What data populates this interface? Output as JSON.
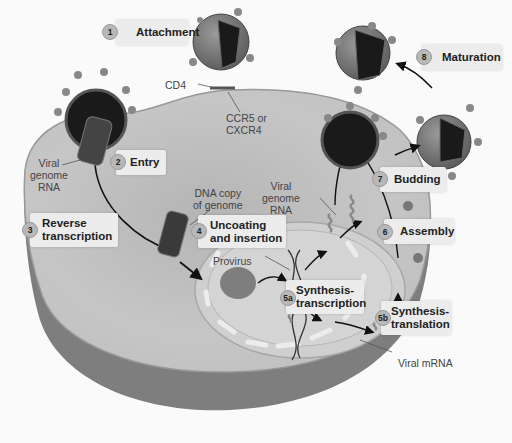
{
  "diagram": {
    "colors": {
      "background": "#fafafa",
      "cell_cytoplasm": "#c4c4c4",
      "cell_edge": "#8a8a8a",
      "nucleus": "#cfcfcf",
      "virus_core": "#1a1a1a",
      "label_box": "#ececec",
      "step_circle": "#b8b8b8"
    },
    "steps": [
      {
        "number": "1",
        "label": "Attachment"
      },
      {
        "number": "2",
        "label": "Entry"
      },
      {
        "number": "3",
        "label_line1": "Reverse",
        "label_line2": "transcription"
      },
      {
        "number": "4",
        "label_line1": "Uncoating",
        "label_line2": "and insertion"
      },
      {
        "number": "5a",
        "label_line1": "Synthesis-",
        "label_line2": "transcription"
      },
      {
        "number": "5b",
        "label_line1": "Synthesis-",
        "label_line2": "translation"
      },
      {
        "number": "6",
        "label": "Assembly"
      },
      {
        "number": "7",
        "label": "Budding"
      },
      {
        "number": "8",
        "label": "Maturation"
      }
    ],
    "annotations": {
      "cd4": "CD4",
      "coreceptor_line1": "CCR5 or",
      "coreceptor_line2": "CXCR4",
      "viral_genome_rna_left": [
        "Viral",
        "genome",
        "RNA"
      ],
      "dna_copy": [
        "DNA copy",
        "of genome"
      ],
      "viral_genome_rna_right": [
        "Viral",
        "genome",
        "RNA"
      ],
      "provirus": "Provirus",
      "viral_mrna": "Viral mRNA"
    }
  }
}
